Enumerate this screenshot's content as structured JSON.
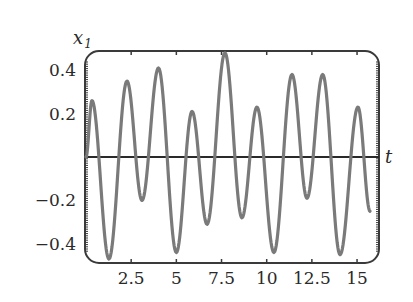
{
  "chart_data": {
    "type": "line",
    "title": "",
    "xlabel": "t",
    "ylabel": "x_1",
    "ylabel_main": "x",
    "ylabel_sub": "1",
    "xlim": [
      0,
      16.3
    ],
    "ylim": [
      -0.49,
      0.49
    ],
    "grid": false,
    "legend": null,
    "x_ticks": [
      2.5,
      5,
      7.5,
      10,
      12.5,
      15
    ],
    "x_tick_labels": [
      "2.5",
      "5",
      "7.5",
      "10",
      "12.5",
      "15"
    ],
    "y_ticks": [
      0.4,
      0.2,
      -0.2,
      -0.4
    ],
    "y_tick_labels": [
      "0.4",
      "0.2",
      "−0.2",
      "−0.4"
    ],
    "series": [
      {
        "name": "x1(t)",
        "color": "#7a7a7a",
        "x": [
          0.0,
          0.33,
          1.27,
          2.27,
          3.1,
          4.01,
          5.0,
          5.87,
          6.7,
          7.69,
          8.63,
          9.46,
          10.4,
          11.4,
          12.23,
          13.1,
          14.06,
          15.05,
          15.72
        ],
        "y": [
          0.0,
          0.26,
          -0.47,
          0.35,
          -0.2,
          0.41,
          -0.44,
          0.21,
          -0.31,
          0.48,
          -0.28,
          0.23,
          -0.44,
          0.38,
          -0.19,
          0.38,
          -0.45,
          0.23,
          -0.25
        ]
      }
    ]
  },
  "colors": {
    "curve": "#7a7a7a",
    "frame": "#3a3a3a",
    "axis": "#2a2a2a",
    "text": "#2a2a2a",
    "background": "#ffffff"
  }
}
